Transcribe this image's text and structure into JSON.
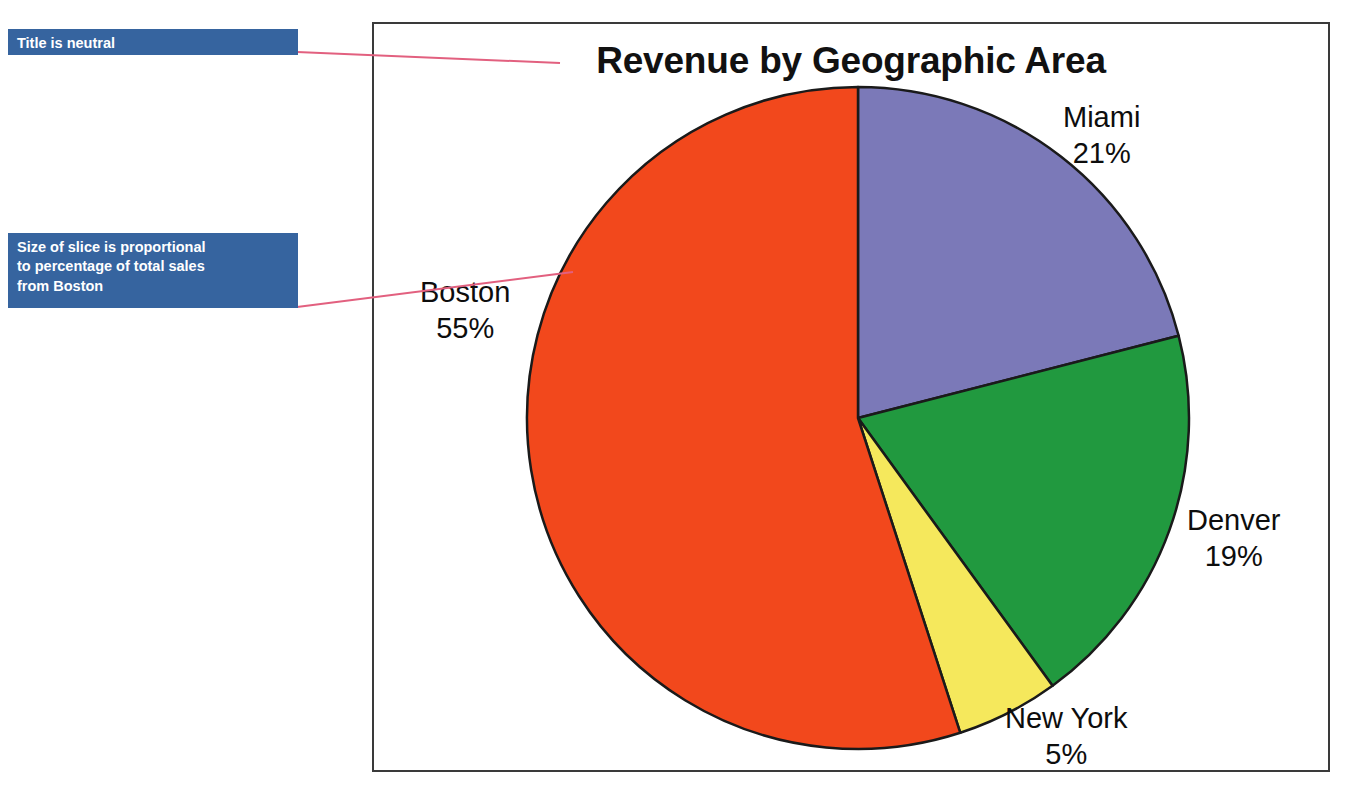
{
  "chart": {
    "title": "Revenue by Geographic Area",
    "frame_border_color": "#3a3a3a"
  },
  "annotations": [
    {
      "id": "title-note",
      "text": "Title is neutral",
      "box_color": "#36649f",
      "text_color": "#ffffff",
      "leader_color": "#e2607f"
    },
    {
      "id": "slice-note",
      "text": "Size of slice is proportional to percentage of total sales from Boston",
      "line1": "Size of slice is proportional",
      "line2": "to percentage of total sales",
      "line3": "from Boston",
      "box_color": "#36649f",
      "text_color": "#ffffff",
      "leader_color": "#e2607f"
    }
  ],
  "labels": {
    "miami": {
      "name": "Miami",
      "pct": "21%"
    },
    "denver": {
      "name": "Denver",
      "pct": "19%"
    },
    "newyork": {
      "name": "New York",
      "pct": "5%"
    },
    "boston": {
      "name": "Boston",
      "pct": "55%"
    }
  },
  "chart_data": {
    "type": "pie",
    "title": "Revenue by Geographic Area",
    "xlabel": "",
    "ylabel": "",
    "categories": [
      "Miami",
      "Denver",
      "New York",
      "Boston"
    ],
    "values": [
      21,
      19,
      5,
      55
    ],
    "value_unit": "percent",
    "data_labels": [
      "Miami 21%",
      "Denver 19%",
      "New York 5%",
      "Boston 55%"
    ],
    "colors": [
      "#7b79b8",
      "#21993f",
      "#f5e85c",
      "#f2481c"
    ],
    "slice_outline_color": "#1a1a1a",
    "start_angle_deg": 0,
    "direction": "clockwise",
    "legend": "none",
    "grid": false,
    "annotations": [
      "Title is neutral",
      "Size of slice is proportional to percentage of total sales from Boston"
    ]
  }
}
